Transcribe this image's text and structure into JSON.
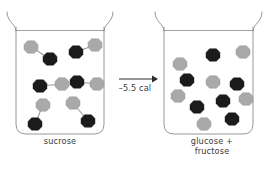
{
  "figure": {
    "type": "chemical-reaction-diagram",
    "background_color": "#ffffff"
  },
  "colors": {
    "light_molecule": "#a9a9a9",
    "dark_molecule": "#1b1b1b",
    "beaker_stroke": "#8c8c8c",
    "bond_stroke": "#9a9a9a",
    "arrow": "#2a2a2a",
    "text": "#3c3c3c"
  },
  "left_beaker": {
    "caption": "sucrose",
    "molecule_count": 6,
    "molecule_type": "disaccharide-dimer",
    "molecules": [
      {
        "id": "sucrose-1",
        "light": {
          "x": 31,
          "y": 47
        },
        "dark": {
          "x": 50,
          "y": 59
        }
      },
      {
        "id": "sucrose-2",
        "light": {
          "x": 95,
          "y": 45
        },
        "dark": {
          "x": 76,
          "y": 52
        }
      },
      {
        "id": "sucrose-3",
        "light": {
          "x": 62,
          "y": 84
        },
        "dark": {
          "x": 40,
          "y": 86
        }
      },
      {
        "id": "sucrose-4",
        "light": {
          "x": 97,
          "y": 84
        },
        "dark": {
          "x": 77,
          "y": 82
        }
      },
      {
        "id": "sucrose-5",
        "light": {
          "x": 43,
          "y": 105
        },
        "dark": {
          "x": 35,
          "y": 124
        }
      },
      {
        "id": "sucrose-6",
        "light": {
          "x": 73,
          "y": 103
        },
        "dark": {
          "x": 88,
          "y": 121
        }
      }
    ]
  },
  "right_beaker": {
    "caption": "glucose +\nfructose",
    "molecule_count": 12,
    "molecule_type": "monosaccharide",
    "molecules": [
      {
        "id": "mono-1",
        "shade": "light",
        "x": 180,
        "y": 64
      },
      {
        "id": "mono-2",
        "shade": "dark",
        "x": 213,
        "y": 55
      },
      {
        "id": "mono-3",
        "shade": "light",
        "x": 243,
        "y": 52
      },
      {
        "id": "mono-4",
        "shade": "dark",
        "x": 187,
        "y": 80
      },
      {
        "id": "mono-5",
        "shade": "light",
        "x": 213,
        "y": 82
      },
      {
        "id": "mono-6",
        "shade": "dark",
        "x": 237,
        "y": 84
      },
      {
        "id": "mono-7",
        "shade": "light",
        "x": 178,
        "y": 96
      },
      {
        "id": "mono-8",
        "shade": "dark",
        "x": 197,
        "y": 107
      },
      {
        "id": "mono-9",
        "shade": "dark",
        "x": 223,
        "y": 101
      },
      {
        "id": "mono-10",
        "shade": "light",
        "x": 246,
        "y": 99
      },
      {
        "id": "mono-11",
        "shade": "light",
        "x": 204,
        "y": 124
      },
      {
        "id": "mono-12",
        "shade": "dark",
        "x": 232,
        "y": 119
      }
    ]
  },
  "reaction": {
    "energy_label": "–5.5 cal",
    "arrow_direction": "right"
  }
}
